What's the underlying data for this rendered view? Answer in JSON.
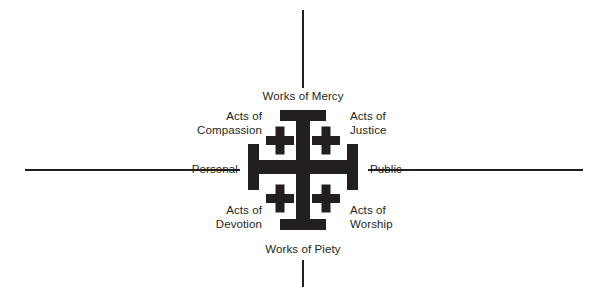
{
  "diagram": {
    "colors": {
      "ink": "#231f20",
      "background": "#ffffff"
    },
    "axes": {
      "vertical": {
        "top_label": "Works of Mercy",
        "bottom_label": "Works of Piety"
      },
      "horizontal": {
        "left_label": "Personal",
        "right_label": "Public"
      }
    },
    "quadrants": [
      {
        "position": "top-left",
        "label": "Acts of\nCompassion"
      },
      {
        "position": "top-right",
        "label": "Acts of\nJustice"
      },
      {
        "position": "bottom-left",
        "label": "Acts of\nDevotion"
      },
      {
        "position": "bottom-right",
        "label": "Acts of\nWorship"
      }
    ],
    "symbol": {
      "name": "jerusalem-cross",
      "description": "Large cross potent with four small Greek crosses in the quadrants"
    }
  }
}
